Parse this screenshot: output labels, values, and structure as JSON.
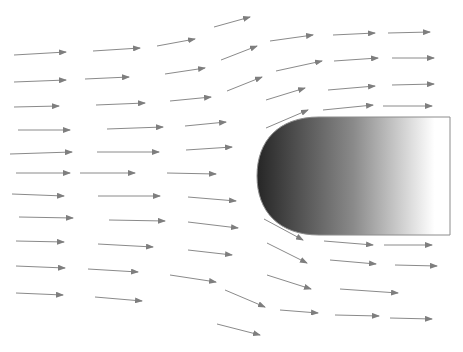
{
  "diagram": {
    "type": "flow-field-around-body",
    "width": 463,
    "height": 352,
    "colors": {
      "background": "#ffffff",
      "arrow": "#8a8a8a",
      "body_stroke": "#8c8c8c",
      "gradient_start": "#262626",
      "gradient_mid": "#8a8a8a",
      "gradient_end": "#ffffff"
    },
    "body": {
      "shape": "rounded-nose-blunt-body",
      "left": 257,
      "top": 117,
      "right": 450,
      "bottom": 235,
      "nose_radius": 62
    },
    "arrows": [
      [
        14,
        55,
        66,
        52
      ],
      [
        14,
        82,
        66,
        80
      ],
      [
        14,
        107,
        59,
        106
      ],
      [
        18,
        130,
        70,
        130
      ],
      [
        10,
        154,
        72,
        152
      ],
      [
        16,
        173,
        70,
        173
      ],
      [
        12,
        194,
        64,
        196
      ],
      [
        19,
        217,
        73,
        218
      ],
      [
        16,
        241,
        64,
        242
      ],
      [
        16,
        266,
        65,
        268
      ],
      [
        16,
        293,
        63,
        295
      ],
      [
        93,
        51,
        140,
        48
      ],
      [
        85,
        79,
        129,
        77
      ],
      [
        96,
        105,
        145,
        103
      ],
      [
        107,
        129,
        163,
        127
      ],
      [
        97,
        152,
        159,
        152
      ],
      [
        80,
        173,
        135,
        173
      ],
      [
        98,
        196,
        160,
        196
      ],
      [
        109,
        220,
        165,
        221
      ],
      [
        98,
        244,
        153,
        247
      ],
      [
        88,
        269,
        138,
        272
      ],
      [
        95,
        297,
        142,
        301
      ],
      [
        157,
        46,
        195,
        39
      ],
      [
        165,
        74,
        205,
        68
      ],
      [
        170,
        101,
        211,
        97
      ],
      [
        185,
        126,
        226,
        122
      ],
      [
        186,
        150,
        232,
        147
      ],
      [
        167,
        173,
        216,
        174
      ],
      [
        188,
        197,
        236,
        201
      ],
      [
        188,
        222,
        238,
        228
      ],
      [
        188,
        250,
        232,
        255
      ],
      [
        170,
        275,
        216,
        282
      ],
      [
        217,
        324,
        260,
        335
      ],
      [
        214,
        27,
        250,
        17
      ],
      [
        221,
        60,
        257,
        46
      ],
      [
        227,
        91,
        262,
        77
      ],
      [
        270,
        41,
        313,
        35
      ],
      [
        276,
        71,
        322,
        61
      ],
      [
        266,
        100,
        305,
        88
      ],
      [
        266,
        128,
        308,
        110
      ],
      [
        333,
        35,
        375,
        33
      ],
      [
        334,
        61,
        378,
        58
      ],
      [
        328,
        90,
        375,
        86
      ],
      [
        323,
        110,
        373,
        105
      ],
      [
        388,
        33,
        430,
        32
      ],
      [
        392,
        58,
        434,
        58
      ],
      [
        392,
        85,
        434,
        84
      ],
      [
        383,
        106,
        432,
        106
      ],
      [
        264,
        219,
        303,
        240
      ],
      [
        267,
        243,
        307,
        263
      ],
      [
        267,
        275,
        311,
        289
      ],
      [
        225,
        290,
        265,
        307
      ],
      [
        280,
        310,
        318,
        313
      ],
      [
        324,
        241,
        373,
        245
      ],
      [
        330,
        260,
        376,
        264
      ],
      [
        340,
        289,
        398,
        293
      ],
      [
        335,
        315,
        379,
        316
      ],
      [
        384,
        245,
        432,
        245
      ],
      [
        395,
        265,
        437,
        266
      ],
      [
        390,
        318,
        432,
        319
      ]
    ]
  }
}
